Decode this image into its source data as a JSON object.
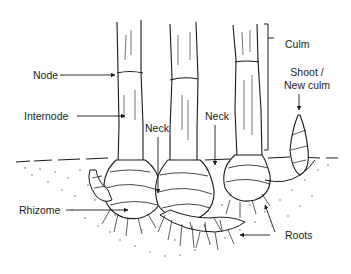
{
  "diagram": {
    "labels": {
      "node": "Node",
      "internode": "Internode",
      "neck_left": "Neck",
      "neck_right": "Neck",
      "culm": "Culm",
      "shoot_line1": "Shoot /",
      "shoot_line2": "New culm",
      "rhizome": "Rhizome",
      "roots": "Roots"
    },
    "colors": {
      "ink": "#1a1a1a",
      "background": "#ffffff",
      "soil_dots": "#555555"
    }
  }
}
